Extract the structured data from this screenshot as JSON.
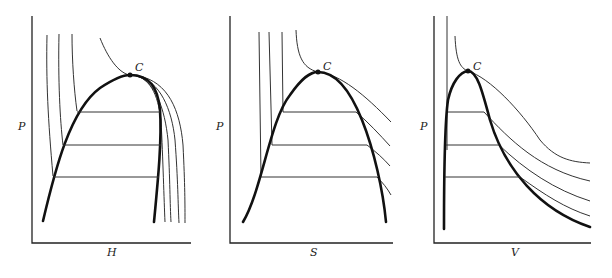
{
  "panels": [
    {
      "id": "ph",
      "xlabel": "H",
      "ylabel": "P",
      "critical_label": "C"
    },
    {
      "id": "ps",
      "xlabel": "S",
      "ylabel": "P",
      "critical_label": "C"
    },
    {
      "id": "pv",
      "xlabel": "V",
      "ylabel": "P",
      "critical_label": "C"
    }
  ],
  "colors": {
    "line": "#111111",
    "background": "#ffffff"
  }
}
